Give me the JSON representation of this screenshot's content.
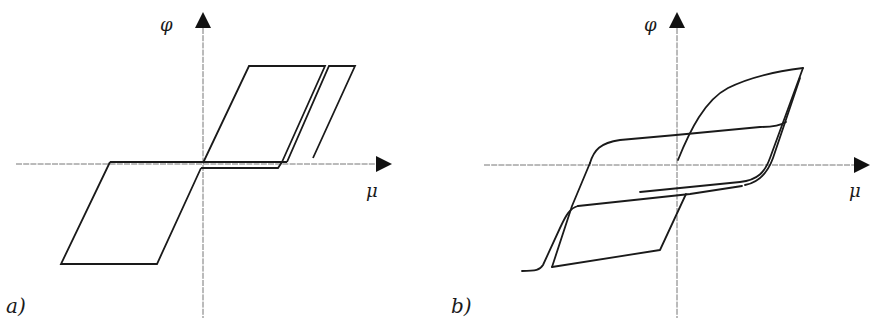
{
  "figure": {
    "panels": [
      {
        "id": "a",
        "label": "a)",
        "y_axis_label": "φ",
        "x_axis_label": "μ",
        "description": "Idealized piecewise-linear (bilinear/rectangular) hysteresis loops"
      },
      {
        "id": "b",
        "label": "b)",
        "y_axis_label": "φ",
        "x_axis_label": "μ",
        "description": "Smooth curved hysteresis loops"
      }
    ],
    "colors": {
      "stroke": "#1a1a1a",
      "axis": "#555555",
      "background": "#ffffff"
    }
  }
}
